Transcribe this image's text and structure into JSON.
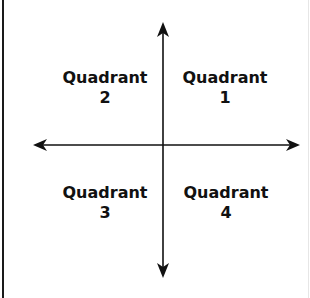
{
  "diagram": {
    "title": "",
    "quadrants": [
      {
        "id": "q1",
        "name": "Quadrant",
        "number": "1"
      },
      {
        "id": "q2",
        "name": "Quadrant",
        "number": "2"
      },
      {
        "id": "q3",
        "name": "Quadrant",
        "number": "3"
      },
      {
        "id": "q4",
        "name": "Quadrant",
        "number": "4"
      }
    ],
    "colors": {
      "axis": "#111111",
      "text": "#111111",
      "background": "#ffffff"
    }
  }
}
